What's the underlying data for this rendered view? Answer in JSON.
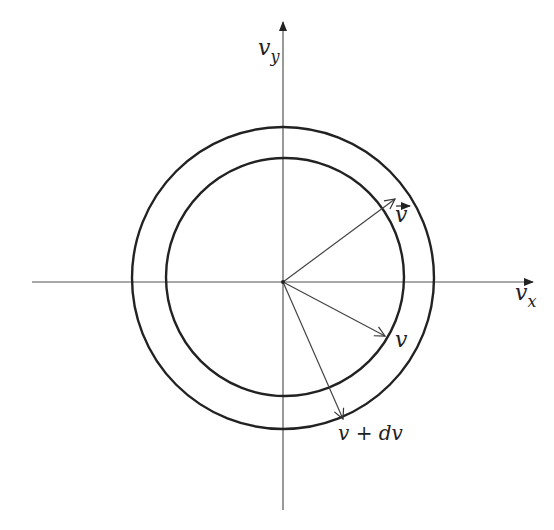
{
  "diagram": {
    "type": "velocity-space shell",
    "axes": {
      "x_label": "v",
      "x_subscript": "x",
      "y_label": "v",
      "y_subscript": "y"
    },
    "circles": [
      {
        "name": "inner",
        "radius_label": "v"
      },
      {
        "name": "outer",
        "radius_label": "v + dv"
      }
    ],
    "vectors": [
      {
        "name": "velocity-vector",
        "label": "v",
        "overarrow": true
      },
      {
        "name": "inner-radius-vector",
        "label": "v"
      },
      {
        "name": "outer-radius-vector",
        "label": "v + dv"
      }
    ],
    "colors": {
      "stroke": "#222222",
      "axis": "#555555",
      "background": "#ffffff"
    }
  }
}
